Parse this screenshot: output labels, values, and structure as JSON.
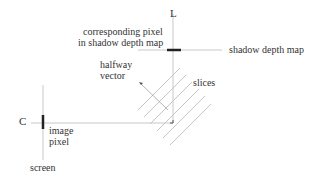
{
  "labels": {
    "light": "L",
    "camera": "C",
    "corresponding_pixel_line1": "corresponding pixel",
    "corresponding_pixel_line2": "in shadow depth map",
    "shadow_depth_map": "shadow depth map",
    "halfway_vector_line1": "halfway",
    "halfway_vector_line2": "vector",
    "slices": "slices",
    "image_pixel_line1": "image",
    "image_pixel_line2": "pixel",
    "screen": "screen"
  },
  "colors": {
    "thin_line": "#c8c8c8",
    "thick_bar": "#222222",
    "slice_line": "#c4c4c4",
    "text": "#333333",
    "background": "#ffffff"
  },
  "geometry": {
    "light_axis": {
      "x": 173,
      "y1": 14,
      "y2": 123
    },
    "depth_map_line": {
      "y": 50,
      "x1": 138,
      "x2": 222
    },
    "depth_map_bar": {
      "y": 50,
      "x1": 167,
      "x2": 181
    },
    "view_ray": {
      "y": 123,
      "x1": 31,
      "x2": 173
    },
    "screen_line": {
      "x": 43,
      "y1": 85,
      "y2": 160
    },
    "screen_bar": {
      "x": 43,
      "y1": 115,
      "y2": 129
    },
    "halfway_vector": {
      "x1": 139,
      "y1": 82,
      "x2": 168,
      "y2": 110
    },
    "slices": [
      {
        "x1": 138,
        "y1": 110,
        "x2": 180,
        "y2": 68
      },
      {
        "x1": 143,
        "y1": 118,
        "x2": 186,
        "y2": 75
      },
      {
        "x1": 151,
        "y1": 124,
        "x2": 192,
        "y2": 83
      },
      {
        "x1": 157,
        "y1": 131,
        "x2": 199,
        "y2": 89
      },
      {
        "x1": 163,
        "y1": 138,
        "x2": 205,
        "y2": 96
      },
      {
        "x1": 170,
        "y1": 145,
        "x2": 211,
        "y2": 104
      }
    ]
  }
}
